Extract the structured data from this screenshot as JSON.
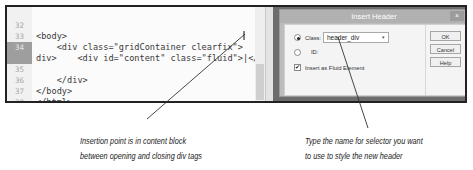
{
  "editor": {
    "lines": [
      {
        "number": "32",
        "code": "<body>"
      },
      {
        "number": "33",
        "code": "    <div class=\"gridContainer clearfix\">"
      },
      {
        "number": "34",
        "code": "        <div id=\"content\" class=\"fluid\">|</"
      },
      {
        "number": "",
        "code": "div>"
      },
      {
        "number": "35",
        "code": "    </div>"
      },
      {
        "number": "36",
        "code": "</body>"
      },
      {
        "number": "37",
        "code": "</html>"
      },
      {
        "number": "38",
        "code": ""
      }
    ],
    "active_line": "34"
  },
  "dialog": {
    "title": "Insert Header",
    "close_glyph": "×",
    "class_label": "Class:",
    "class_value": "header_div",
    "combo_arrow": "▾",
    "id_label": "ID:",
    "fluid_label": "Insert as Fluid Element",
    "fluid_checked_glyph": "✔",
    "buttons": {
      "ok": "OK",
      "cancel": "Cancel",
      "help": "Help"
    }
  },
  "captions": {
    "left_line1": "Insertion point is in content block",
    "left_line2": "between opening and closing div tags",
    "right_line1": "Type the name for selector you want",
    "right_line2": "to use to style the new header"
  }
}
